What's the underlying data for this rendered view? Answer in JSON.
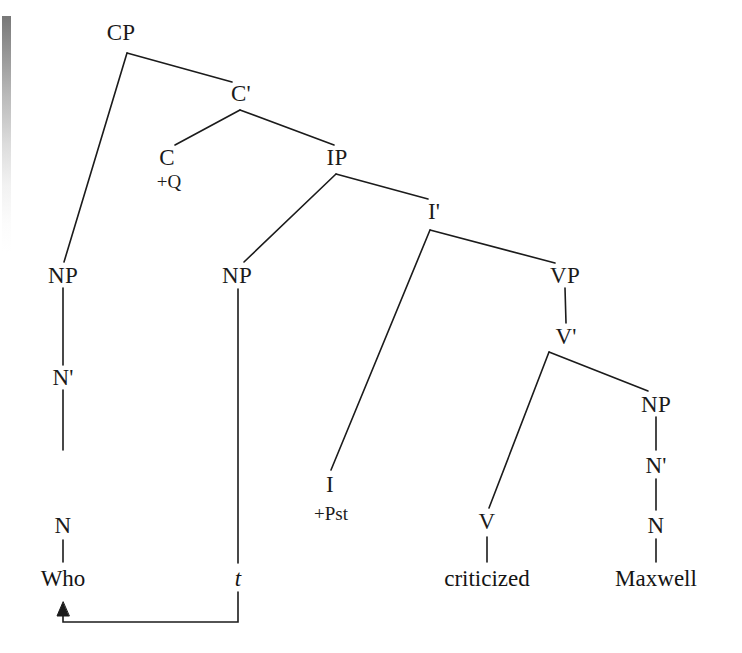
{
  "figure": {
    "type": "syntax-tree",
    "sentence": "Who criticized Maxwell",
    "line_color": "#1b1b1b",
    "background_color": "#ffffff"
  },
  "nodes": {
    "cp": "CP",
    "cbar": "C'",
    "c": "C",
    "c_feature": "+Q",
    "ip": "IP",
    "ibar": "I'",
    "np_spec_cp": "NP",
    "nbar_spec_cp": "N'",
    "n_spec_cp": "N",
    "np_spec_ip": "NP",
    "i": "I",
    "i_feature": "+Pst",
    "vp": "VP",
    "vbar": "V'",
    "v": "V",
    "np_object": "NP",
    "nbar_object": "N'",
    "n_object": "N"
  },
  "terminals": {
    "who": "Who",
    "trace": "t",
    "criticized": "criticized",
    "maxwell": "Maxwell"
  },
  "movement": {
    "name": "wh-movement-arrow",
    "from": "t",
    "to": "Who"
  }
}
